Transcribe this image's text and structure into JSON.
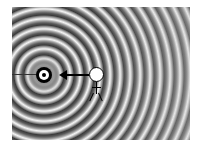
{
  "figure": {
    "type": "wave-diagram",
    "elements": {
      "source": {
        "label": "source",
        "shape": "bullseye"
      },
      "observer": {
        "label": "observer",
        "shape": "stick-figure"
      },
      "arrow": {
        "direction": "left",
        "from": "observer",
        "to": "source"
      }
    },
    "colors": {
      "ring_dark": "#3a3a3a",
      "ring_light": "#f4f4f4",
      "source": "#000000",
      "observer_head": "#ffffff"
    }
  },
  "caption": {
    "text": ""
  }
}
